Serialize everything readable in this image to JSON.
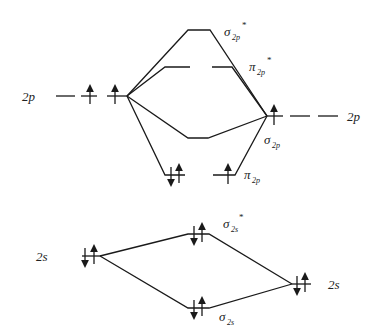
{
  "diagram": {
    "left_atom": {
      "p_label": "2p",
      "p_electrons": [
        "up",
        "up",
        ""
      ],
      "s_label": "2s",
      "s_electrons": "down-up"
    },
    "right_atom": {
      "p_label": "2p",
      "p_electrons": [
        "up",
        "",
        ""
      ],
      "s_label": "2s",
      "s_electrons": "down-up"
    },
    "orbitals": {
      "sigma2p_star": {
        "symbol": "σ",
        "sub": "2p",
        "sup": "*",
        "electrons": ""
      },
      "pi2p_star": {
        "symbol": "π",
        "sub": "2p",
        "sup": "*",
        "electrons": [
          "",
          ""
        ]
      },
      "sigma2p": {
        "symbol": "σ",
        "sub": "2p",
        "sup": "",
        "electrons": ""
      },
      "pi2p": {
        "symbol": "π",
        "sub": "2p",
        "sup": "",
        "electrons": [
          "down-up",
          "up"
        ]
      },
      "sigma2s_star": {
        "symbol": "σ",
        "sub": "2s",
        "sup": "*",
        "electrons": "down-up"
      },
      "sigma2s": {
        "symbol": "σ",
        "sub": "2s",
        "sup": "",
        "electrons": "down-up"
      }
    },
    "colors": {
      "line": "#1a1a1a",
      "text": "#222222",
      "background": "#ffffff"
    }
  }
}
